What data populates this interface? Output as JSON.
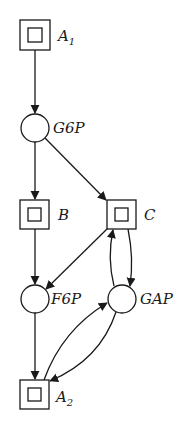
{
  "diagram": {
    "type": "petri-net",
    "stroke_color": "#1a1a1a",
    "background": "#ffffff",
    "nodes": [
      {
        "id": "A1",
        "kind": "transition",
        "label": "A",
        "subscript": "1"
      },
      {
        "id": "G6P",
        "kind": "place",
        "label": "G6P"
      },
      {
        "id": "B",
        "kind": "transition",
        "label": "B"
      },
      {
        "id": "C",
        "kind": "transition",
        "label": "C"
      },
      {
        "id": "F6P",
        "kind": "place",
        "label": "F6P"
      },
      {
        "id": "GAP",
        "kind": "place",
        "label": "GAP"
      },
      {
        "id": "A2",
        "kind": "transition",
        "label": "A",
        "subscript": "2"
      }
    ],
    "edges": [
      {
        "from": "A1",
        "to": "G6P"
      },
      {
        "from": "G6P",
        "to": "B"
      },
      {
        "from": "G6P",
        "to": "C"
      },
      {
        "from": "B",
        "to": "F6P"
      },
      {
        "from": "C",
        "to": "F6P"
      },
      {
        "from": "C",
        "to": "GAP"
      },
      {
        "from": "GAP",
        "to": "C"
      },
      {
        "from": "F6P",
        "to": "A2"
      },
      {
        "from": "GAP",
        "to": "A2"
      },
      {
        "from": "A2",
        "to": "GAP"
      }
    ]
  }
}
